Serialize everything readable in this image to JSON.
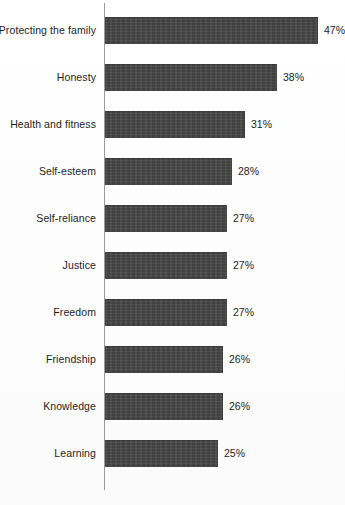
{
  "chart_data": {
    "type": "bar",
    "orientation": "horizontal",
    "title": "",
    "xlabel": "",
    "ylabel": "",
    "xlim": [
      0,
      47
    ],
    "grid": false,
    "legend": null,
    "value_suffix": "%",
    "categories": [
      "Protecting the family",
      "Honesty",
      "Health and fitness",
      "Self-esteem",
      "Self-reliance",
      "Justice",
      "Freedom",
      "Friendship",
      "Knowledge",
      "Learning"
    ],
    "values": [
      47,
      38,
      31,
      28,
      27,
      27,
      27,
      26,
      26,
      25
    ],
    "value_labels": [
      "47%",
      "38%",
      "31%",
      "28%",
      "27%",
      "27%",
      "27%",
      "26%",
      "26%",
      "25%"
    ],
    "bar_color": "#464646",
    "axis_color": "#9a9a9a",
    "label_color": "#1c1c1c"
  },
  "footnote": {
    "text": "",
    "visible": false
  }
}
